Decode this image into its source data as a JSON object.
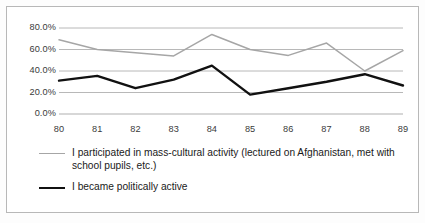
{
  "chart_data": {
    "type": "line",
    "title": "",
    "subtitle": "",
    "xlabel": "",
    "ylabel": "",
    "x": [
      "80",
      "81",
      "82",
      "83",
      "84",
      "85",
      "86",
      "87",
      "88",
      "89"
    ],
    "categories": [
      "80",
      "81",
      "82",
      "83",
      "84",
      "85",
      "86",
      "87",
      "88",
      "89"
    ],
    "ylim": [
      0,
      80
    ],
    "ytick_values": [
      80,
      60,
      40,
      20,
      0
    ],
    "ytick_labels": [
      "80.0%",
      "60.0%",
      "40.0%",
      "20.0%",
      "0.0%"
    ],
    "grid": true,
    "legend_position": "bottom-left",
    "series": [
      {
        "name": "I participated in mass-cultural activity (lectured on Afghanistan, met with school pupils, etc.)",
        "color": "#a6a6a6",
        "values": [
          69.0,
          60.0,
          57.0,
          54.0,
          74.0,
          60.0,
          54.5,
          66.0,
          40.0,
          59.0
        ]
      },
      {
        "name": "I became politically active",
        "color": "#111111",
        "values": [
          31.0,
          35.5,
          24.0,
          32.0,
          45.0,
          18.0,
          24.0,
          30.0,
          37.0,
          26.5
        ]
      }
    ]
  },
  "legend": {
    "entries": [
      {
        "label": "I participated in mass-cultural activity (lectured on Afghanistan, met with school pupils, etc.)",
        "marker": "line-marker-gray"
      },
      {
        "label": "I became politically active",
        "marker": "line-marker-black"
      }
    ]
  },
  "colors": {
    "series_gray": "#a6a6a6",
    "series_black": "#111111",
    "gridline": "#b0b0b0",
    "frame_border": "#b8b8b8",
    "text": "#1a1a1a",
    "background": "#ffffff"
  }
}
